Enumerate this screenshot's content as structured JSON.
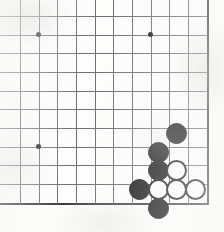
{
  "figure": {
    "kind": "go-board-diagram",
    "width": 224,
    "height": 232,
    "caption": "",
    "caption_note": "caption text is cropped off at the bottom edge and illegible"
  },
  "board": {
    "columns": 11,
    "rows": 11,
    "origin_x": 20,
    "origin_y": 16,
    "spacing": 18.67,
    "line_color": "#6d6d70",
    "edge_color": "#3a3a3c",
    "paper_color": "#fdfdfc",
    "right_edge_col": 10,
    "bottom_edge_row": 10,
    "star_points": [
      {
        "col": 1,
        "row": 1
      },
      {
        "col": 7,
        "row": 1
      },
      {
        "col": 1,
        "row": 7
      }
    ]
  },
  "stones": [
    {
      "color": "black",
      "col": 8.4,
      "row": 6.27,
      "radius": 10.5,
      "label": "black-stone-1"
    },
    {
      "color": "black",
      "col": 7.4,
      "row": 7.3,
      "radius": 10.5,
      "label": "black-stone-2"
    },
    {
      "color": "black",
      "col": 7.4,
      "row": 8.25,
      "radius": 10.5,
      "label": "black-stone-3"
    },
    {
      "color": "black",
      "col": 6.4,
      "row": 9.27,
      "radius": 10.5,
      "label": "black-stone-4"
    },
    {
      "color": "black",
      "col": 7.4,
      "row": 10.3,
      "radius": 10.5,
      "label": "black-stone-5"
    },
    {
      "color": "white",
      "col": 8.4,
      "row": 8.25,
      "radius": 10.5,
      "label": "white-stone-1"
    },
    {
      "color": "white",
      "col": 7.4,
      "row": 9.27,
      "radius": 10.5,
      "label": "white-stone-2"
    },
    {
      "color": "white",
      "col": 8.4,
      "row": 9.27,
      "radius": 10.5,
      "label": "white-stone-3"
    },
    {
      "color": "white",
      "col": 9.4,
      "row": 9.27,
      "radius": 10.5,
      "label": "white-stone-4"
    }
  ]
}
